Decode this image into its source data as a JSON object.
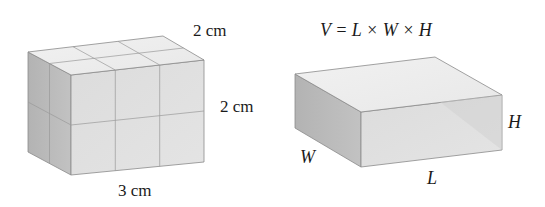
{
  "left_figure": {
    "description": "Rectangular prism built from unit cubes (3 × 2 × 2)",
    "labels": {
      "depth": "2 cm",
      "height": "2 cm",
      "length": "3 cm"
    },
    "grid": {
      "length_units": 3,
      "depth_units": 2,
      "height_units": 2
    }
  },
  "right_figure": {
    "description": "General rectangular prism",
    "formula": "V = L × W × H",
    "labels": {
      "length": "L",
      "width": "W",
      "height": "H"
    }
  },
  "colors": {
    "top_face": "#ececec",
    "front_face": "#dedede",
    "side_face": "#b9b9b9",
    "edge": "#8a8a8a",
    "text": "#1a1a1a"
  }
}
